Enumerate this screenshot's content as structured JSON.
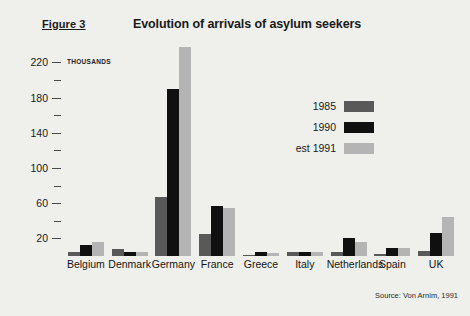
{
  "figure": {
    "label": "Figure 3",
    "title": "Evolution of arrivals of asylum seekers",
    "source": "Source: Von Arnim, 1991",
    "units_label": "THOUSANDS"
  },
  "legend": {
    "position": "inside-top-right",
    "items": [
      {
        "label": "1985",
        "color": "#595959"
      },
      {
        "label": "1990",
        "color": "#101010"
      },
      {
        "label": "est 1991",
        "color": "#b4b4b4"
      }
    ]
  },
  "axis": {
    "y_major_ticks": [
      "20",
      "60",
      "100",
      "140",
      "180",
      "220"
    ],
    "y_minor_ticks": [
      "40",
      "80",
      "120",
      "160",
      "200"
    ],
    "y_min": 0,
    "y_max": 240
  },
  "chart_data": {
    "type": "bar",
    "title": "Evolution of arrivals of asylum seekers",
    "xlabel": "",
    "ylabel": "THOUSANDS",
    "ylim": [
      0,
      240
    ],
    "grid": false,
    "legend_position": "inside-top-right",
    "categories": [
      "Belgium",
      "Denmark",
      "Germany",
      "France",
      "Greece",
      "Italy",
      "Netherlands",
      "Spain",
      "UK"
    ],
    "series": [
      {
        "name": "1985",
        "color": "#595959",
        "values": [
          5,
          8,
          67,
          25,
          1,
          5,
          5,
          2,
          6
        ]
      },
      {
        "name": "1990",
        "color": "#101010",
        "values": [
          13,
          5,
          190,
          57,
          4,
          5,
          21,
          9,
          26
        ]
      },
      {
        "name": "est 1991",
        "color": "#b4b4b4",
        "values": [
          16,
          4,
          238,
          55,
          3,
          4,
          16,
          9,
          44
        ]
      }
    ]
  }
}
